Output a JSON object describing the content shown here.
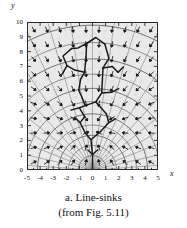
{
  "figure": {
    "caption_line1": "a. Line-sinks",
    "caption_line2": "(from Fig. 5.11)",
    "xlabel": "x",
    "ylabel": "y"
  },
  "chart_data": {
    "type": "scatter",
    "title": "a. Line-sinks",
    "subtitle": "(from Fig. 5.11)",
    "xlabel": "x",
    "ylabel": "y",
    "xlim": [
      -5,
      5
    ],
    "ylim": [
      0,
      10
    ],
    "xticks": [
      -5,
      -4,
      -3,
      -2,
      -1,
      0,
      1,
      2,
      3,
      4,
      5
    ],
    "yticks": [
      0,
      1,
      2,
      3,
      4,
      5,
      6,
      7,
      8,
      9,
      10
    ],
    "grid": false,
    "legend": "none",
    "series": [
      {
        "name": "line-sink network",
        "type": "polyline-set",
        "color": "#1b1b1b",
        "paths": [
          [
            [
              0.0,
              0.0
            ],
            [
              0.0,
              1.05
            ],
            [
              -0.35,
              1.35
            ],
            [
              0.0,
              1.05
            ],
            [
              0.38,
              1.35
            ]
          ],
          [
            [
              0.0,
              1.05
            ],
            [
              -0.12,
              2.05
            ],
            [
              -0.55,
              2.5
            ],
            [
              -0.12,
              2.05
            ],
            [
              0.62,
              2.6
            ]
          ],
          [
            [
              -0.55,
              2.5
            ],
            [
              -0.95,
              3.2
            ],
            [
              -1.35,
              3.55
            ],
            [
              -0.95,
              3.2
            ],
            [
              -0.6,
              3.6
            ]
          ],
          [
            [
              0.62,
              2.6
            ],
            [
              1.25,
              3.2
            ],
            [
              1.75,
              3.45
            ],
            [
              1.25,
              3.2
            ],
            [
              1.05,
              3.8
            ]
          ],
          [
            [
              -0.6,
              3.6
            ],
            [
              -1.0,
              4.2
            ],
            [
              -1.65,
              4.05
            ],
            [
              -1.0,
              4.2
            ],
            [
              -0.55,
              4.35
            ]
          ],
          [
            [
              -0.55,
              4.35
            ],
            [
              0.25,
              4.6
            ],
            [
              1.05,
              3.8
            ]
          ],
          [
            [
              0.25,
              4.6
            ],
            [
              0.7,
              5.2
            ],
            [
              1.45,
              5.25
            ]
          ],
          [
            [
              -0.55,
              4.35
            ],
            [
              -0.85,
              5.0
            ],
            [
              -1.05,
              5.4
            ]
          ],
          [
            [
              -1.05,
              5.4
            ],
            [
              -0.9,
              6.15
            ],
            [
              -0.6,
              6.6
            ]
          ],
          [
            [
              -0.6,
              6.6
            ],
            [
              -1.35,
              6.75
            ],
            [
              -1.95,
              7.05
            ]
          ],
          [
            [
              -1.95,
              7.05
            ],
            [
              -2.25,
              7.7
            ],
            [
              -1.6,
              8.2
            ]
          ],
          [
            [
              -1.95,
              7.05
            ],
            [
              -2.3,
              6.5
            ]
          ],
          [
            [
              -0.6,
              6.6
            ],
            [
              -0.5,
              7.6
            ],
            [
              -0.45,
              8.55
            ]
          ],
          [
            [
              -0.45,
              8.55
            ],
            [
              0.25,
              8.95
            ],
            [
              0.95,
              8.5
            ]
          ],
          [
            [
              -0.45,
              8.55
            ],
            [
              -1.1,
              8.25
            ],
            [
              -1.6,
              8.2
            ]
          ],
          [
            [
              0.7,
              5.2
            ],
            [
              0.75,
              6.0
            ],
            [
              0.8,
              6.9
            ]
          ],
          [
            [
              0.8,
              6.9
            ],
            [
              1.5,
              7.0
            ],
            [
              1.95,
              6.6
            ]
          ],
          [
            [
              0.8,
              6.9
            ],
            [
              1.25,
              7.55
            ],
            [
              0.95,
              8.5
            ]
          ],
          [
            [
              1.45,
              5.25
            ],
            [
              2.0,
              5.5
            ]
          ],
          [
            [
              1.95,
              6.6
            ],
            [
              2.35,
              6.95
            ]
          ]
        ]
      },
      {
        "name": "equipotential contours",
        "type": "nested-arcs",
        "color": "#4a4a4a",
        "count": 9
      },
      {
        "name": "velocity vectors",
        "type": "quiver",
        "color": "#1b1b1b",
        "direction": "inward toward sink network",
        "grid_spacing": 1.0
      }
    ]
  }
}
